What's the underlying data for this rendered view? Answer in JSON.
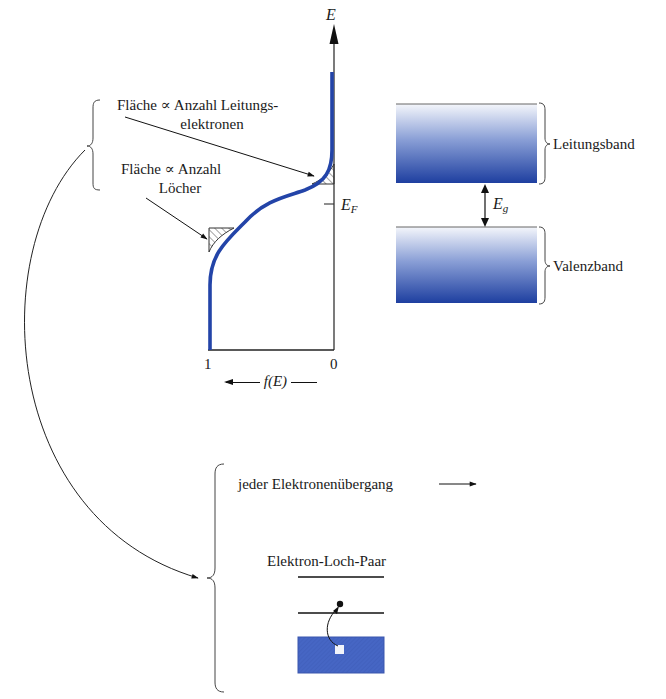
{
  "axis": {
    "energy_label": "E",
    "fermi_label": "E",
    "fermi_sub": "F",
    "x_left_tick": "1",
    "x_right_tick": "0",
    "x_label": "f(E)"
  },
  "annotations": {
    "conduction_area_line1": "Fläche ∝ Anzahl Leitungs-",
    "conduction_area_line2": "elektronen",
    "holes_area_line1": "Fläche ∝ Anzahl",
    "holes_area_line2": "Löcher"
  },
  "bands": {
    "conduction_band": "Leitungsband",
    "valence_band": "Valenzband",
    "gap_label": "E",
    "gap_sub": "g",
    "band_color_top": "#f4f6fb",
    "band_color_bottom": "#1e3fa0"
  },
  "transition": {
    "caption": "jeder Elektronenübergang",
    "pair_label": "Elektron-Loch-Paar",
    "box_color": "#4666c4"
  },
  "colors": {
    "curve": "#2344a8",
    "lines": "#222222"
  }
}
